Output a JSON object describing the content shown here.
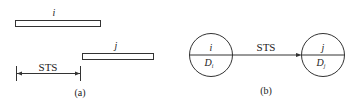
{
  "panel_a": {
    "caption": "(a)",
    "bar_i_label": "i",
    "bar_j_label": "j",
    "interval_label": "STS"
  },
  "panel_b": {
    "caption": "(b)",
    "node_i": {
      "top": "i",
      "bottom": "D",
      "bottom_sub": "i"
    },
    "node_j": {
      "top": "j",
      "bottom": "D",
      "bottom_sub": "j"
    },
    "edge_label": "STS"
  }
}
